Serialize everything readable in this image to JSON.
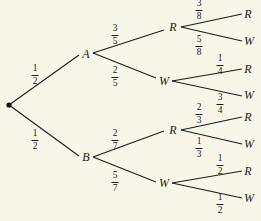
{
  "diagram": {
    "type": "probability-tree",
    "root": {
      "label": ""
    },
    "level1": [
      {
        "label": "A",
        "prob_num": "1",
        "prob_den": "2"
      },
      {
        "label": "B",
        "prob_num": "1",
        "prob_den": "2"
      }
    ],
    "level2": [
      {
        "parent": "A",
        "label": "R",
        "prob_num": "3",
        "prob_den": "5"
      },
      {
        "parent": "A",
        "label": "W",
        "prob_num": "2",
        "prob_den": "5"
      },
      {
        "parent": "B",
        "label": "R",
        "prob_num": "2",
        "prob_den": "7"
      },
      {
        "parent": "B",
        "label": "W",
        "prob_num": "5",
        "prob_den": "7"
      }
    ],
    "level3": [
      {
        "parent": "A-R",
        "label": "R",
        "prob_num": "3",
        "prob_den": "8"
      },
      {
        "parent": "A-R",
        "label": "W",
        "prob_num": "5",
        "prob_den": "8"
      },
      {
        "parent": "A-W",
        "label": "R",
        "prob_num": "1",
        "prob_den": "4"
      },
      {
        "parent": "A-W",
        "label": "W",
        "prob_num": "3",
        "prob_den": "4"
      },
      {
        "parent": "B-R",
        "label": "R",
        "prob_num": "2",
        "prob_den": "3"
      },
      {
        "parent": "B-R",
        "label": "W",
        "prob_num": "1",
        "prob_den": "3"
      },
      {
        "parent": "B-W",
        "label": "R",
        "prob_num": "1",
        "prob_den": "2"
      },
      {
        "parent": "B-W",
        "label": "W",
        "prob_num": "1",
        "prob_den": "2"
      }
    ]
  }
}
